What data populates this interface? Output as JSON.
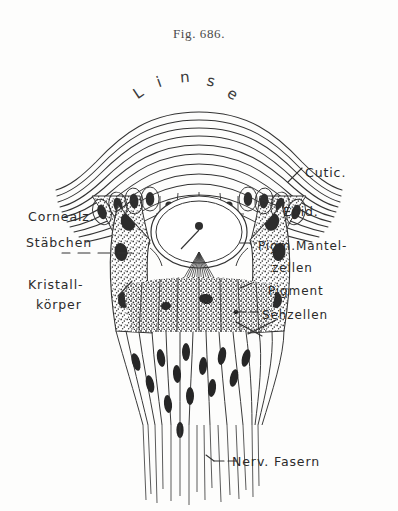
{
  "figure": {
    "caption": "Fig. 686.",
    "subject_labels": {
      "lens_arc_text": "Linse",
      "lens_letters": [
        "L",
        "i",
        "n",
        "s",
        "e"
      ]
    },
    "labels_left": [
      {
        "id": "cornealz",
        "text": "Cornealz.",
        "x": 28,
        "y": 217
      },
      {
        "id": "staebchen",
        "text": "Stäbchen",
        "x": 26,
        "y": 243
      },
      {
        "id": "kristall",
        "text": "Kristall-",
        "x": 28,
        "y": 283
      },
      {
        "id": "koerper",
        "text": "körper",
        "x": 36,
        "y": 303
      }
    ],
    "labels_right": [
      {
        "id": "cutic",
        "text": "Cutic.",
        "x": 305,
        "y": 172
      },
      {
        "id": "epid",
        "text": "Epid.",
        "x": 283,
        "y": 211
      },
      {
        "id": "pigm-mantel",
        "text": "Pigm.Mantel-",
        "x": 258,
        "y": 247
      },
      {
        "id": "zellen",
        "text": "zellen",
        "x": 272,
        "y": 269
      },
      {
        "id": "pigment",
        "text": "Pigment",
        "x": 268,
        "y": 292
      },
      {
        "id": "sehzellen",
        "text": "Sehzellen",
        "x": 262,
        "y": 316
      }
    ],
    "labels_bottom": [
      {
        "id": "nerv-fasern",
        "text": "Nerv. Fasern",
        "x": 232,
        "y": 464
      }
    ],
    "colors": {
      "ink": "#2b2b2b",
      "ink_light": "#4a4a4a",
      "pigment_fill": "#3a3a3a",
      "paper": "#fdfdfc"
    }
  }
}
